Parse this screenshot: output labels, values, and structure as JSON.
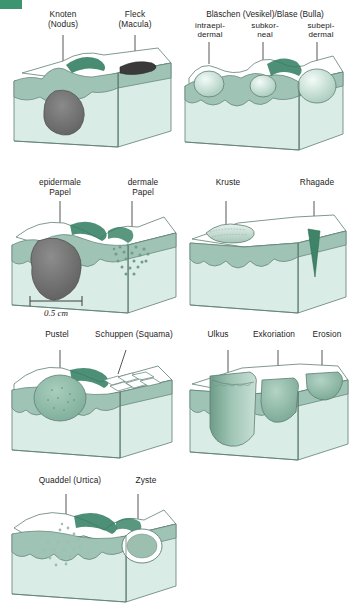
{
  "figure": {
    "title_tab": "",
    "rows": [
      {
        "id": "row1",
        "panels": [
          {
            "id": "panel-nodus-macula",
            "labels": [
              {
                "name": "knoten",
                "line1": "Knoten",
                "line2": "(Nodus)"
              },
              {
                "name": "fleck",
                "line1": "Fleck",
                "line2": "(Macula)"
              }
            ]
          },
          {
            "id": "panel-blaeschen",
            "heading": "Bläschen (Vesikel)/Blase (Bulla)",
            "labels": [
              {
                "name": "intraepidermal",
                "line1": "intraepi-",
                "line2": "dermal"
              },
              {
                "name": "subkorneal",
                "line1": "subkor-",
                "line2": "neal"
              },
              {
                "name": "subepidermal",
                "line1": "subepi-",
                "line2": "dermal"
              }
            ]
          }
        ]
      },
      {
        "id": "row2",
        "panels": [
          {
            "id": "panel-papel",
            "labels": [
              {
                "name": "epidermale-papel",
                "line1": "epidermale",
                "line2": "Papel"
              },
              {
                "name": "dermale-papel",
                "line1": "dermale",
                "line2": "Papel"
              }
            ],
            "scalebar": "0.5 cm"
          },
          {
            "id": "panel-kruste-rhagade",
            "labels": [
              {
                "name": "kruste",
                "line1": "Kruste",
                "line2": ""
              },
              {
                "name": "rhagade",
                "line1": "Rhagade",
                "line2": ""
              }
            ]
          }
        ]
      },
      {
        "id": "row3",
        "panels": [
          {
            "id": "panel-pustel-schuppen",
            "labels": [
              {
                "name": "pustel",
                "line1": "Pustel",
                "line2": ""
              },
              {
                "name": "schuppen",
                "line1": "Schuppen (Squama)",
                "line2": ""
              }
            ]
          },
          {
            "id": "panel-ulkus",
            "labels": [
              {
                "name": "ulkus",
                "line1": "Ulkus",
                "line2": ""
              },
              {
                "name": "exkoriation",
                "line1": "Exkoriation",
                "line2": ""
              },
              {
                "name": "erosion",
                "line1": "Erosion",
                "line2": ""
              }
            ]
          }
        ]
      },
      {
        "id": "row4",
        "panels": [
          {
            "id": "panel-quaddel-zyste",
            "labels": [
              {
                "name": "quaddel",
                "line1": "Quaddel (Urtica)",
                "line2": ""
              },
              {
                "name": "zyste",
                "line1": "Zyste",
                "line2": ""
              }
            ]
          }
        ]
      }
    ],
    "colors": {
      "epidermis": "#9fc3b4",
      "dermis": "#d9ece6",
      "surface": "#ffffff",
      "outline": "#5f7f74",
      "dark_lesion": "#6e6e6e",
      "dark_green": "#2f7d5f",
      "accent_tab": "#3d9470",
      "leader_line": "#2b2b2b"
    }
  }
}
